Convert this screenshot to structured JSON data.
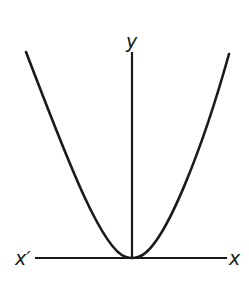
{
  "diagram": {
    "type": "parabola-graph",
    "labels": {
      "y_axis": "y",
      "x_axis_negative": "x′",
      "x_axis_positive": "x"
    },
    "colors": {
      "stroke": "#1a1a1a",
      "background": "#ffffff"
    }
  }
}
